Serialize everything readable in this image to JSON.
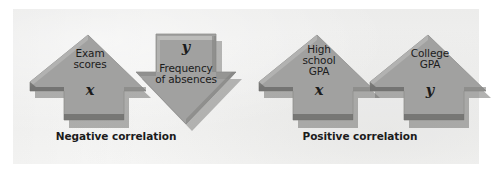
{
  "figure": {
    "background_color": "#ffffff",
    "panel_color": "#f1f1f0",
    "arrow_fill": "#9d9d9c",
    "arrow_shade": "#6f6f6e",
    "arrow_highlight": "#b9b9b7",
    "text_color": "#121212"
  },
  "groups": [
    {
      "name": "negative-correlation",
      "caption": "Negative correlation",
      "arrows": [
        {
          "name": "exam-scores-arrow",
          "direction": "up",
          "words": "Exam\nscores",
          "variable": "x"
        },
        {
          "name": "frequency-of-absences-arrow",
          "direction": "down",
          "words": "Frequency\nof absences",
          "variable": "y"
        }
      ]
    },
    {
      "name": "positive-correlation",
      "caption": "Positive correlation",
      "arrows": [
        {
          "name": "high-school-gpa-arrow",
          "direction": "up",
          "words": "High\nschool\nGPA",
          "variable": "x"
        },
        {
          "name": "college-gpa-arrow",
          "direction": "up",
          "words": "College\nGPA",
          "variable": "y"
        }
      ]
    }
  ]
}
